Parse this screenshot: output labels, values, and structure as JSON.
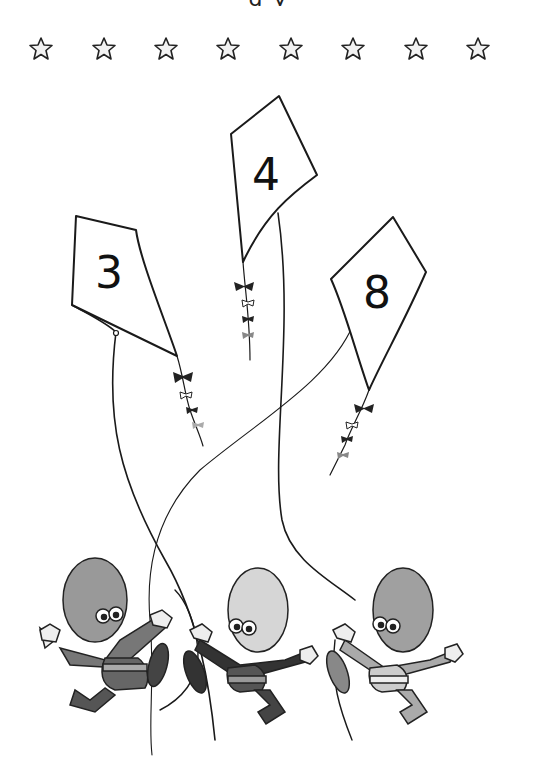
{
  "worksheet": {
    "title_fragment": "g           y",
    "stars": {
      "count": 8,
      "positions_x": [
        40,
        103,
        165,
        227,
        290,
        352,
        415,
        477
      ]
    },
    "kites": [
      {
        "id": "left",
        "number": "3",
        "number_x": 112,
        "number_y": 288
      },
      {
        "id": "middle",
        "number": "4",
        "number_x": 267,
        "number_y": 187
      },
      {
        "id": "right",
        "number": "8",
        "number_x": 378,
        "number_y": 308
      }
    ],
    "characters": [
      {
        "id": "left",
        "shade": "#8a8a8a",
        "head_shade": "#999999"
      },
      {
        "id": "middle",
        "shade": "#444444",
        "head_shade": "#d6d6d6"
      },
      {
        "id": "right",
        "shade": "#9a9a9a",
        "head_shade": "#a0a0a0"
      }
    ],
    "colors": {
      "background": "#ffffff",
      "ink": "#1a1a1a",
      "star_fill": "#f2f2f2"
    }
  }
}
